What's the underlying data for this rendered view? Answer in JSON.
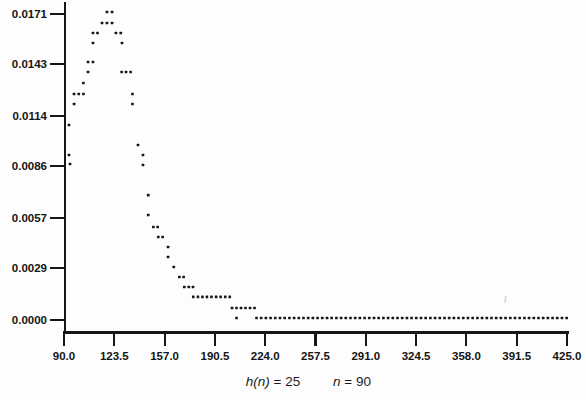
{
  "figure": {
    "background": "#fdfdfd",
    "ink_color": "#161616",
    "tick_label_color": "#141414"
  },
  "chart_data": {
    "type": "scatter",
    "title": "",
    "xlabel": "",
    "ylabel": "",
    "grid": false,
    "legend": null,
    "marker": "small-square-dot",
    "x_axis": {
      "range": [
        90,
        425
      ],
      "tick_values": [
        90.0,
        123.5,
        157.0,
        190.5,
        224.0,
        257.5,
        291.0,
        324.5,
        358.0,
        391.5,
        425.0
      ],
      "tick_labels": [
        "90.0",
        "123.5",
        "157.0",
        "190.5",
        "224.0",
        "257.5",
        "291.0",
        "324.5",
        "358.0",
        "391.5",
        "425.0"
      ]
    },
    "y_axis": {
      "range": [
        0,
        0.0171
      ],
      "tick_values": [
        0.0171,
        0.0143,
        0.0114,
        0.0086,
        0.0057,
        0.0029,
        0.0
      ],
      "tick_labels": [
        "0.0171",
        "0.0143",
        "0.0114",
        "0.0086",
        "0.0057",
        "0.0029",
        "0.0000"
      ]
    },
    "points": [
      [
        94.0,
        0.00872
      ],
      [
        93.3,
        0.00922
      ],
      [
        93.3,
        0.0109
      ],
      [
        96.7,
        0.01207
      ],
      [
        96.7,
        0.01263
      ],
      [
        99.8,
        0.01263
      ],
      [
        102.9,
        0.01263
      ],
      [
        102.9,
        0.01324
      ],
      [
        106.0,
        0.01386
      ],
      [
        106.0,
        0.01442
      ],
      [
        109.3,
        0.01442
      ],
      [
        109.3,
        0.01548
      ],
      [
        109.3,
        0.01604
      ],
      [
        112.3,
        0.01604
      ],
      [
        115.3,
        0.0166
      ],
      [
        118.6,
        0.0166
      ],
      [
        122.0,
        0.0166
      ],
      [
        118.6,
        0.01721
      ],
      [
        122.0,
        0.01721
      ],
      [
        124.6,
        0.01604
      ],
      [
        127.8,
        0.01604
      ],
      [
        128.6,
        0.01548
      ],
      [
        128.4,
        0.01386
      ],
      [
        131.3,
        0.01386
      ],
      [
        134.4,
        0.01386
      ],
      [
        135.6,
        0.01263
      ],
      [
        135.6,
        0.01207
      ],
      [
        139.3,
        0.00978
      ],
      [
        142.6,
        0.00922
      ],
      [
        142.6,
        0.00866
      ],
      [
        146.1,
        0.00698
      ],
      [
        146.1,
        0.00587
      ],
      [
        149.5,
        0.0052
      ],
      [
        152.4,
        0.0052
      ],
      [
        152.8,
        0.00464
      ],
      [
        155.7,
        0.00464
      ],
      [
        159.3,
        0.00408
      ],
      [
        159.3,
        0.00352
      ],
      [
        163.1,
        0.00296
      ],
      [
        166.8,
        0.0024
      ],
      [
        169.7,
        0.0024
      ],
      [
        170.1,
        0.00184
      ],
      [
        173.1,
        0.00184
      ],
      [
        175.9,
        0.00184
      ],
      [
        176.1,
        0.00129
      ],
      [
        179.2,
        0.00129
      ],
      [
        182.2,
        0.00129
      ],
      [
        185.2,
        0.00129
      ],
      [
        188.2,
        0.00129
      ],
      [
        191.3,
        0.00129
      ],
      [
        194.3,
        0.00129
      ],
      [
        197.4,
        0.00129
      ],
      [
        200.4,
        0.00129
      ],
      [
        201.9,
        0.00067
      ],
      [
        204.9,
        0.00067
      ],
      [
        207.9,
        0.00067
      ],
      [
        210.9,
        0.00067
      ],
      [
        213.9,
        0.00067
      ],
      [
        216.9,
        0.00067
      ],
      [
        204.9,
        0.00011
      ]
    ],
    "tail_run": {
      "value": 0.00011,
      "x_start": 218.2,
      "x_step": 3.13,
      "count": 67
    },
    "caption": {
      "left_var": "h(n)",
      "left_rest": " = 25",
      "right_var": "n",
      "right_rest": " = 90"
    }
  },
  "artifacts": {
    "speck": {
      "px_x": 505,
      "px_y": 296,
      "color": "#c5c5c5"
    }
  }
}
